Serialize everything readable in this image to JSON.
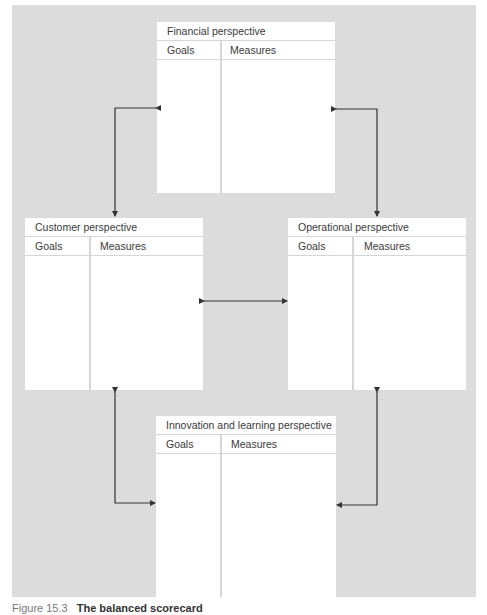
{
  "diagram": {
    "boxes": {
      "financial": {
        "title": "Financial perspective",
        "goals_label": "Goals",
        "measures_label": "Measures"
      },
      "customer": {
        "title": "Customer perspective",
        "goals_label": "Goals",
        "measures_label": "Measures"
      },
      "operational": {
        "title": "Operational perspective",
        "goals_label": "Goals",
        "measures_label": "Measures"
      },
      "innovation": {
        "title": "Innovation and learning perspective",
        "goals_label": "Goals",
        "measures_label": "Measures"
      }
    },
    "connections": [
      {
        "from": "financial",
        "to": "customer",
        "type": "bidirectional"
      },
      {
        "from": "financial",
        "to": "operational",
        "type": "bidirectional"
      },
      {
        "from": "customer",
        "to": "operational",
        "type": "bidirectional"
      },
      {
        "from": "customer",
        "to": "innovation",
        "type": "bidirectional"
      },
      {
        "from": "operational",
        "to": "innovation",
        "type": "bidirectional"
      }
    ],
    "colors": {
      "background_panel": "#dcdcdc",
      "box": "#ffffff",
      "rule": "#d6d6d6",
      "arrow": "#333333"
    }
  },
  "caption": {
    "figure_number": "Figure 15.3",
    "title": "The balanced scorecard"
  }
}
